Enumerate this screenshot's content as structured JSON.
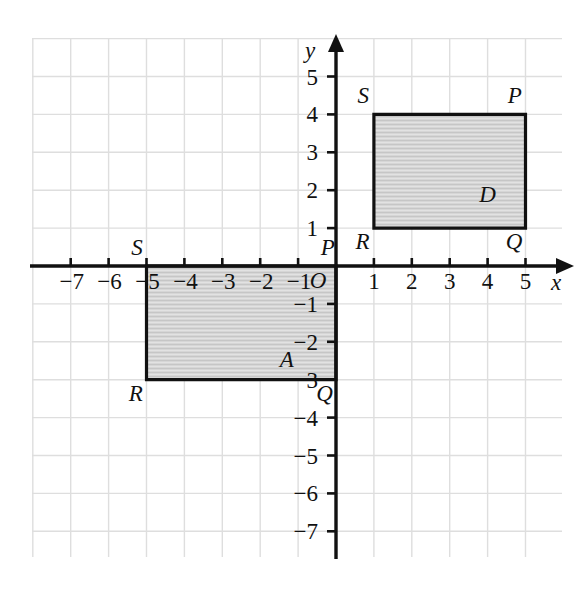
{
  "figure": {
    "background_color": "#ffffff",
    "grid_color": "#dedede",
    "axis_color": "#111111",
    "shape_fill": "#d4d4d4",
    "shape_stroke": "#111111"
  },
  "axes": {
    "x_label": "x",
    "y_label": "y",
    "origin_label": "O",
    "x_ticks": [
      "-7",
      "-6",
      "-5",
      "-4",
      "-3",
      "-2",
      "-1",
      "1",
      "2",
      "3",
      "4",
      "5"
    ],
    "y_ticks": [
      "5",
      "4",
      "3",
      "2",
      "1",
      "-1",
      "-2",
      "-3",
      "-4",
      "-5",
      "-6",
      "-7"
    ],
    "x_range": [
      -8,
      6
    ],
    "y_range": [
      -8,
      6
    ],
    "grid_spacing_units": 1
  },
  "chart_data": {
    "type": "scatter",
    "xlabel": "x",
    "ylabel": "y",
    "xlim": [
      -8,
      6
    ],
    "ylim": [
      -8,
      6
    ],
    "grid": true,
    "legend": "none",
    "shapes": [
      {
        "name": "A",
        "label": "A",
        "label_position": {
          "x": -1.3,
          "y": -2.45
        },
        "vertices": [
          {
            "label": "P",
            "x": 0,
            "y": 0,
            "label_offset": {
              "dx": -0.22,
              "dy": 0.5
            }
          },
          {
            "label": "S",
            "x": -5,
            "y": 0,
            "label_offset": {
              "dx": -0.25,
              "dy": 0.5
            }
          },
          {
            "label": "R",
            "x": -5,
            "y": -3,
            "label_offset": {
              "dx": -0.28,
              "dy": -0.35
            }
          },
          {
            "label": "Q",
            "x": 0,
            "y": -3,
            "label_offset": {
              "dx": -0.3,
              "dy": -0.35
            }
          }
        ],
        "width": 5,
        "height": 3
      },
      {
        "name": "D",
        "label": "D",
        "label_position": {
          "x": 4.0,
          "y": 1.9
        },
        "vertices": [
          {
            "label": "S",
            "x": 1,
            "y": 4,
            "label_offset": {
              "dx": -0.28,
              "dy": 0.52
            }
          },
          {
            "label": "P",
            "x": 5,
            "y": 4,
            "label_offset": {
              "dx": -0.28,
              "dy": 0.52
            }
          },
          {
            "label": "Q",
            "x": 5,
            "y": 1,
            "label_offset": {
              "dx": -0.3,
              "dy": -0.35
            }
          },
          {
            "label": "R",
            "x": 1,
            "y": 1,
            "label_offset": {
              "dx": -0.3,
              "dy": -0.35
            }
          }
        ],
        "width": 4,
        "height": 3
      }
    ]
  }
}
